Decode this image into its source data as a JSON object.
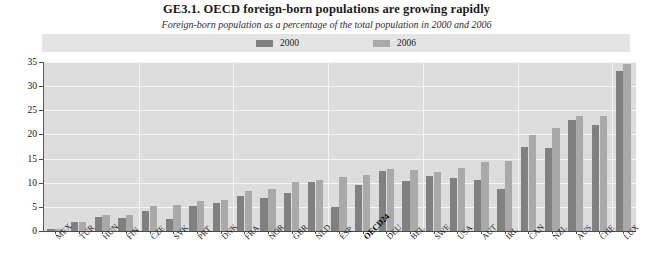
{
  "title": "GE3.1.  OECD foreign-born populations are growing rapidly",
  "subtitle": "Foreign-born population as a percentage of the total population in 2000 and 2006",
  "legend": {
    "entries": [
      {
        "label": "2000",
        "color": "#808080",
        "icon": "legend-swatch-2000"
      },
      {
        "label": "2006",
        "color": "#a9a9a9",
        "icon": "legend-swatch-2006"
      }
    ]
  },
  "colors": {
    "series_2000": "#808080",
    "series_2006": "#a9a9a9",
    "plot_background": "#dcdcdc",
    "legend_background": "#e4e4e4",
    "gridline": "#f4f4f4",
    "axis": "#4a4a4a"
  },
  "chart_data": {
    "type": "bar",
    "title": "GE3.1.  OECD foreign-born populations are growing rapidly",
    "subtitle": "Foreign-born population as a percentage of the total population in 2000 and 2006",
    "xlabel": "",
    "ylabel": "",
    "ylim": [
      0,
      35
    ],
    "yticks": [
      0,
      5,
      10,
      15,
      20,
      25,
      30,
      35
    ],
    "grid": true,
    "legend_position": "top-center",
    "highlight_category": "OECD24",
    "categories": [
      "MEX",
      "TUR",
      "HUN",
      "FIN",
      "CZE",
      "SVK",
      "PRT",
      "DNK",
      "FRA",
      "NOR",
      "GBR",
      "NLD",
      "ESP",
      "OECD24",
      "DEU",
      "BEL",
      "SWE",
      "USA",
      "AUT",
      "IRL",
      "CAN",
      "NZL",
      "AUS",
      "CHE",
      "LUX"
    ],
    "series": [
      {
        "name": "2000",
        "color": "#808080",
        "values": [
          0.5,
          1.9,
          2.9,
          2.6,
          4.2,
          2.5,
          5.1,
          5.8,
          7.3,
          6.8,
          7.9,
          10.1,
          4.9,
          9.5,
          12.4,
          10.3,
          11.3,
          11.0,
          10.5,
          8.7,
          17.4,
          17.2,
          23.0,
          21.9,
          33.2
        ],
        "values_label": "Foreign-born population as % of total population, 2000"
      },
      {
        "name": "2006",
        "color": "#a9a9a9",
        "values": [
          0.5,
          1.9,
          3.3,
          3.4,
          5.1,
          5.3,
          6.3,
          6.5,
          8.2,
          8.7,
          10.1,
          10.6,
          11.1,
          11.7,
          12.9,
          12.6,
          12.3,
          13.0,
          14.2,
          14.4,
          19.8,
          21.4,
          23.8,
          23.8,
          34.5
        ],
        "values_label": "Foreign-born population as % of total population, 2006"
      }
    ]
  }
}
